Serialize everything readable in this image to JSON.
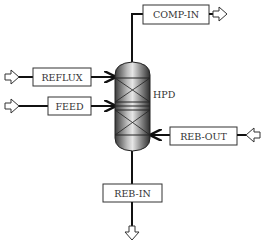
{
  "diagram": {
    "type": "process-flow",
    "vessel": {
      "label": "HPD",
      "kind": "packed-distillation-column",
      "packed_sections": 2
    },
    "streams": [
      {
        "id": "comp-in",
        "label": "COMP-IN",
        "direction": "outlet",
        "position": "top"
      },
      {
        "id": "reflux",
        "label": "REFLUX",
        "direction": "inlet",
        "position": "left-upper"
      },
      {
        "id": "feed",
        "label": "FEED",
        "direction": "inlet",
        "position": "left-lower"
      },
      {
        "id": "reb-out",
        "label": "REB-OUT",
        "direction": "inlet",
        "position": "right-lower"
      },
      {
        "id": "reb-in",
        "label": "REB-IN",
        "direction": "outlet",
        "position": "bottom"
      }
    ]
  }
}
